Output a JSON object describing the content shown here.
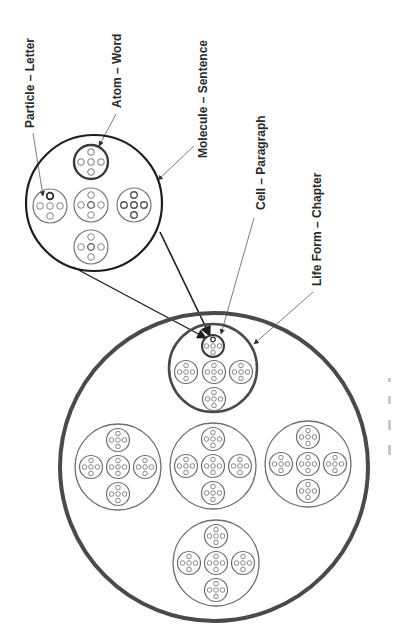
{
  "diagram": {
    "labels": {
      "particle": "Particle – Letter",
      "atom": "Atom – Word",
      "molecule": "Molecule – Sentence",
      "cell": "Cell – Paragraph",
      "life_form": "Life Form – Chapter"
    },
    "colors": {
      "background": "#ffffff",
      "thick_outline": "#4a4a4a",
      "thin_outline": "#6e6e6e",
      "dark_line": "#1e1e1e",
      "leader_line": "#6e6e6e",
      "text": "#2a2a2a"
    },
    "structure": {
      "organism_contains": 5,
      "life_form_contains_cells": 5,
      "cell_contains_particles": 5
    }
  }
}
